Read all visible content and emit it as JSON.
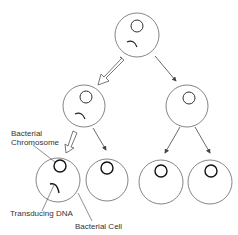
{
  "diagram": {
    "labels": {
      "chromosome_line1": "Bacterial",
      "chromosome_line2": "Chromosome",
      "transducing_dna": "Transducing DNA",
      "bacterial_cell": "Bacterial Cell"
    },
    "colors": {
      "stroke": "#555555",
      "chromosome": "#222222",
      "background": "#ffffff"
    },
    "cells": [
      {
        "id": "parent",
        "cx": 137,
        "cy": 35,
        "r": 22,
        "has_transducing_dna": true
      },
      {
        "id": "gen1-left",
        "cx": 84,
        "cy": 105,
        "r": 21,
        "has_transducing_dna": true
      },
      {
        "id": "gen1-right",
        "cx": 187,
        "cy": 105,
        "r": 21,
        "has_transducing_dna": false
      },
      {
        "id": "gen2-a",
        "cx": 58,
        "cy": 180,
        "r": 22,
        "has_transducing_dna": true
      },
      {
        "id": "gen2-b",
        "cx": 107,
        "cy": 180,
        "r": 21,
        "has_transducing_dna": false
      },
      {
        "id": "gen2-c",
        "cx": 161,
        "cy": 182,
        "r": 22,
        "has_transducing_dna": false
      },
      {
        "id": "gen2-d",
        "cx": 210,
        "cy": 182,
        "r": 22,
        "has_transducing_dna": false
      }
    ],
    "arrows": [
      {
        "from": "parent",
        "to": "gen1-left",
        "style": "hollow"
      },
      {
        "from": "parent",
        "to": "gen1-right",
        "style": "solid"
      },
      {
        "from": "gen1-left",
        "to": "gen2-a",
        "style": "hollow"
      },
      {
        "from": "gen1-left",
        "to": "gen2-b",
        "style": "solid"
      },
      {
        "from": "gen1-right",
        "to": "gen2-c",
        "style": "solid"
      },
      {
        "from": "gen1-right",
        "to": "gen2-d",
        "style": "solid"
      }
    ]
  }
}
